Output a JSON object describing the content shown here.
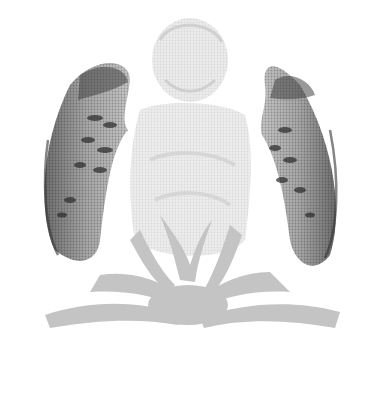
{
  "image": {
    "subject": "halftone illustration of an angel with wings rising from radiating clouds",
    "background": "#ffffff",
    "colors": {
      "wing_dark": "#3a3a3a",
      "wing_mid": "#8a8a8a",
      "wing_light": "#c8c8c8",
      "body": "#e2e2e2",
      "rays": "#b8b8b8"
    }
  }
}
